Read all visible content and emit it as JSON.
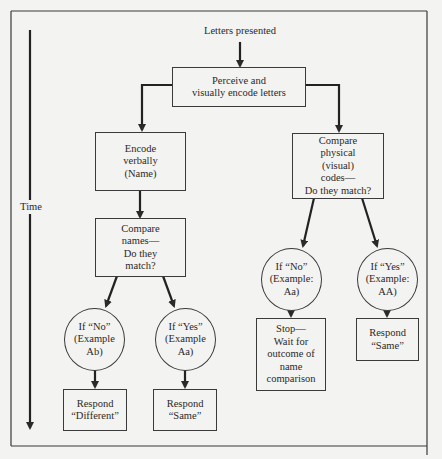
{
  "diagram": {
    "title": "Letters presented",
    "time_label": "Time",
    "nodes": {
      "perceive": [
        "Perceive and",
        "visually encode letters"
      ],
      "encode_verbally": [
        "Encode",
        "verbally",
        "(Name)"
      ],
      "compare_names": [
        "Compare",
        "names—",
        "Do they",
        "match?"
      ],
      "compare_physical": [
        "Compare",
        "physical",
        "(visual)",
        "codes—",
        "Do they match?"
      ],
      "names_no": [
        "If “No”",
        "(Example",
        "Ab)"
      ],
      "names_yes": [
        "If “Yes”",
        "(Example",
        "Aa)"
      ],
      "physical_no": [
        "If “No”",
        "(Example:",
        "Aa)"
      ],
      "physical_yes": [
        "If “Yes”",
        "(Example:",
        "AA)"
      ],
      "respond_different": [
        "Respond",
        "“Different”"
      ],
      "respond_same_names": [
        "Respond",
        "“Same”"
      ],
      "stop_wait": [
        "Stop—",
        "Wait for",
        "outcome of",
        "name",
        "comparison"
      ],
      "respond_same_physical": [
        "Respond",
        "“Same”"
      ]
    },
    "colors": {
      "ink": "#2a2a2a",
      "paper": "#f3f3f1"
    }
  }
}
